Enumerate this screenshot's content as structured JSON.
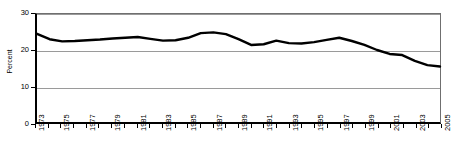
{
  "chart_data": {
    "type": "line",
    "title": "",
    "subtitle": "",
    "xlabel": "",
    "ylabel": "Percent",
    "xlim": [
      1973,
      2005
    ],
    "ylim": [
      0,
      30
    ],
    "yticks": [
      0,
      10,
      20,
      30
    ],
    "ytick_labels": [
      "0",
      "10",
      "20",
      "30"
    ],
    "xticks": [
      1973,
      1974,
      1975,
      1976,
      1977,
      1978,
      1979,
      1980,
      1981,
      1982,
      1983,
      1984,
      1985,
      1986,
      1987,
      1988,
      1989,
      1990,
      1991,
      1992,
      1993,
      1994,
      1995,
      1996,
      1997,
      1998,
      1999,
      2000,
      2001,
      2002,
      2003,
      2004,
      2005
    ],
    "xtick_labels": [
      "1973",
      "1975",
      "1977",
      "1979",
      "1981",
      "1983",
      "1985",
      "1987",
      "1989",
      "1991",
      "1993",
      "1995",
      "1997",
      "1999",
      "2001",
      "2003",
      "2005"
    ],
    "xtick_label_years": [
      1973,
      1975,
      1977,
      1979,
      1981,
      1983,
      1985,
      1987,
      1989,
      1991,
      1993,
      1995,
      1997,
      1999,
      2001,
      2003,
      2005
    ],
    "grid": true,
    "grid_axis": "y",
    "legend": false,
    "legend_position": "none",
    "line_color": "#000000",
    "line_width": 2.4,
    "grid_color": "#9a9a9a",
    "axis_color": "#000000",
    "background": "#ffffff",
    "x": [
      1973,
      1974,
      1975,
      1976,
      1977,
      1978,
      1979,
      1980,
      1981,
      1982,
      1983,
      1984,
      1985,
      1986,
      1987,
      1988,
      1989,
      1990,
      1991,
      1992,
      1993,
      1994,
      1995,
      1996,
      1997,
      1998,
      1999,
      2000,
      2001,
      2002,
      2003,
      2004,
      2005
    ],
    "values": [
      24.5,
      23.0,
      22.4,
      22.5,
      22.7,
      22.9,
      23.2,
      23.4,
      23.6,
      23.1,
      22.6,
      22.7,
      23.4,
      24.7,
      24.9,
      24.4,
      23.0,
      21.4,
      21.6,
      22.6,
      21.9,
      21.8,
      22.2,
      22.8,
      23.4,
      22.5,
      21.4,
      20.0,
      18.9,
      18.6,
      17.0,
      15.8,
      15.4
    ],
    "series": [
      {
        "name": "Percent",
        "values": [
          24.5,
          23.0,
          22.4,
          22.5,
          22.7,
          22.9,
          23.2,
          23.4,
          23.6,
          23.1,
          22.6,
          22.7,
          23.4,
          24.7,
          24.9,
          24.4,
          23.0,
          21.4,
          21.6,
          22.6,
          21.9,
          21.8,
          22.2,
          22.8,
          23.4,
          22.5,
          21.4,
          20.0,
          18.9,
          18.6,
          17.0,
          15.8,
          15.4
        ]
      }
    ]
  }
}
